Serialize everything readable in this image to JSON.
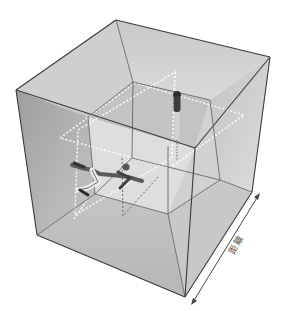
{
  "figure": {
    "label": "距離",
    "arrow": "double-headed distance arrow along bottom-right edge",
    "figures": [
      {
        "name": "standing-figure",
        "position": "top inner plane"
      },
      {
        "name": "lying-figure",
        "position": "left-side inner plane"
      }
    ]
  },
  "colors": {
    "background": "#ffffff",
    "face_light": "#d6d6d6",
    "face_mid": "#bdbdbd",
    "face_dark": "#a8a8a8",
    "edge": "#3a3a3a",
    "dashed_plane": "#ffffff"
  }
}
